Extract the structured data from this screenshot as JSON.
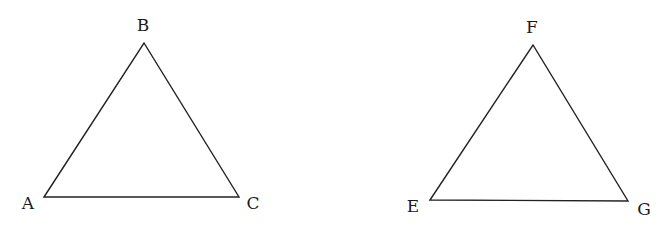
{
  "diagram": {
    "background": "#ffffff",
    "stroke_color": "#222222",
    "triangles": [
      {
        "name": "ABC",
        "vertices": {
          "A": {
            "label": "A",
            "x": 44,
            "y": 197,
            "lx": 28,
            "ly": 209
          },
          "B": {
            "label": "B",
            "x": 144,
            "y": 43,
            "lx": 143,
            "ly": 31
          },
          "C": {
            "label": "C",
            "x": 239,
            "y": 197,
            "lx": 253,
            "ly": 209
          }
        }
      },
      {
        "name": "EFG",
        "vertices": {
          "E": {
            "label": "E",
            "x": 430,
            "y": 200,
            "lx": 413,
            "ly": 212
          },
          "F": {
            "label": "F",
            "x": 533,
            "y": 45,
            "lx": 532,
            "ly": 33
          },
          "G": {
            "label": "G",
            "x": 628,
            "y": 201,
            "lx": 644,
            "ly": 215
          }
        }
      }
    ]
  }
}
